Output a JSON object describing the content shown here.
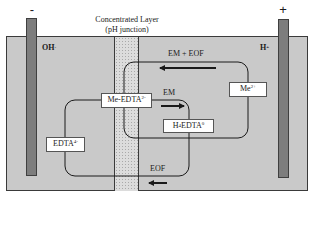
{
  "diagram": {
    "title_line1": "Concentrated Layer",
    "title_line2": "(pH junction)",
    "electrodes": {
      "cathode": {
        "sign": "-",
        "ion": "OH",
        "ion_charge": "-"
      },
      "anode": {
        "sign": "+",
        "ion": "H",
        "ion_charge": "+"
      }
    },
    "species": {
      "me_edta": {
        "base": "Me-EDTA",
        "charge": "2-"
      },
      "h4edta": {
        "prefix": "H",
        "sub": "4",
        "base": "EDTA",
        "charge": "0"
      },
      "me": {
        "base": "Me",
        "charge": "2+"
      },
      "edta": {
        "base": "EDTA",
        "charge": "4-"
      }
    },
    "flows": {
      "em_eof": "EM + EOF",
      "em": "EM",
      "eof": "EOF"
    },
    "colors": {
      "tank_fill": "#c9c9c9",
      "electrode_fill": "#7d7d7d",
      "layer_fill": "#dcdcdc",
      "line": "#1a1a1a"
    }
  }
}
